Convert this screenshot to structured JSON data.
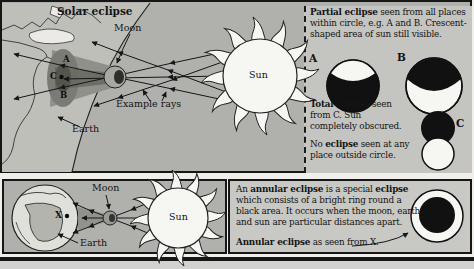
{
  "colors": {
    "panel_bg": "#b0b0ac",
    "legend_bg": "#c4c4c0",
    "ink": "#141414",
    "sun_fill": "#f6f6f2",
    "shadow_dark": "#55554e"
  },
  "top": {
    "title": "Solar eclipse",
    "moon_label": "Moon",
    "sun_label": "Sun",
    "earth_label": "Earth",
    "example_rays_label": "Example rays",
    "point_a": "A",
    "point_b": "B",
    "point_c": "C"
  },
  "legend": {
    "partial_bold": "Partial eclipse",
    "partial_rest": " seen from all places within circle, e.g. A and B. Crescent-shaped area of sun still visible.",
    "label_a": "A",
    "label_b": "B",
    "label_c": "C",
    "total_bold": "Total eclipse",
    "total_rest": " seen from C. Sun completely obscured.",
    "none_pre": "No ",
    "none_bold": "eclipse",
    "none_rest": " seen at any place outside circle."
  },
  "annular": {
    "p_pre": "An ",
    "p_bold1": "annular eclipse",
    "p_mid": " is a special ",
    "p_bold2": "eclipse",
    "p_rest": " which consists of a bright ring round a black area. It occurs when the moon, earth and sun are particular distances apart.",
    "caption_bold": "Annular eclipse",
    "caption_rest": " as seen from X."
  },
  "bottom": {
    "moon_label": "Moon",
    "sun_label": "Sun",
    "earth_label": "Earth",
    "x_label": "X"
  }
}
